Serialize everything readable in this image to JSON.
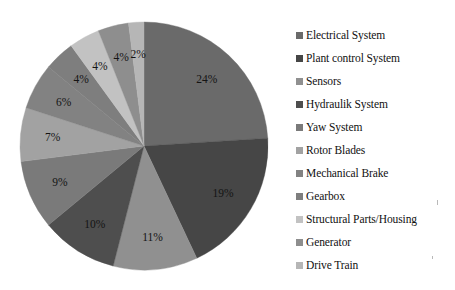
{
  "chart_data": {
    "type": "pie",
    "title": "",
    "subtitle": "",
    "xlabel": "",
    "ylabel": "",
    "legend_position": "right",
    "grid": false,
    "start_angle_deg": 0,
    "direction": "clockwise",
    "categories": [
      "Electrical System",
      "Plant control System",
      "Sensors",
      "Hydraulik System",
      "Yaw System",
      "Rotor Blades",
      "Mechanical Brake",
      "Gearbox",
      "Structural Parts/Housing",
      "Generator",
      "Drive Train"
    ],
    "values": [
      24,
      19,
      11,
      10,
      9,
      7,
      6,
      4,
      4,
      4,
      2
    ],
    "value_labels": [
      "24%",
      "19%",
      "11%",
      "10%",
      "9%",
      "7%",
      "6%",
      "4%",
      "4%",
      "4%",
      "2%"
    ],
    "colors": [
      "#6a6a6a",
      "#464646",
      "#909090",
      "#4e4e4e",
      "#7a7a7a",
      "#a2a2a2",
      "#828282",
      "#7e7e7e",
      "#c2c2c2",
      "#8e8e8e",
      "#b6b6b6"
    ]
  },
  "legend": {
    "items": [
      {
        "label": "Electrical System",
        "swatch": "#6a6a6a"
      },
      {
        "label": "Plant control System",
        "swatch": "#464646"
      },
      {
        "label": "Sensors",
        "swatch": "#909090"
      },
      {
        "label": "Hydraulik System",
        "swatch": "#4e4e4e"
      },
      {
        "label": "Yaw System",
        "swatch": "#7a7a7a"
      },
      {
        "label": "Rotor Blades",
        "swatch": "#a2a2a2"
      },
      {
        "label": "Mechanical Brake",
        "swatch": "#828282"
      },
      {
        "label": "Gearbox",
        "swatch": "#7e7e7e"
      },
      {
        "label": "Structural Parts/Housing",
        "swatch": "#c2c2c2"
      },
      {
        "label": "Generator",
        "swatch": "#8e8e8e"
      },
      {
        "label": "Drive Train",
        "swatch": "#b6b6b6"
      }
    ]
  },
  "geometry": {
    "center_x": 144,
    "center_y": 146,
    "radius": 124,
    "label_radius_ratio": 0.74
  }
}
